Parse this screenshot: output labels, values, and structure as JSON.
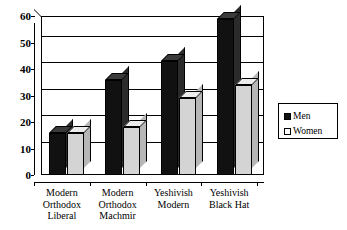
{
  "chart_data": {
    "type": "bar",
    "title": "",
    "subtitle": "",
    "xlabel": "",
    "ylabel": "",
    "ylim": [
      0,
      60
    ],
    "yticks": [
      0,
      10,
      20,
      30,
      40,
      50,
      60
    ],
    "grid": true,
    "legend_position": "right",
    "style": "3d-clustered-column",
    "categories": [
      "Modern Orthodox Liberal",
      "Modern Orthodox Machmir",
      "Yeshivish Modern",
      "Yeshivish Black Hat"
    ],
    "category_lines": [
      [
        "Modern",
        "Orthodox",
        "Liberal"
      ],
      [
        "Modern",
        "Orthodox",
        "Machmir"
      ],
      [
        "Yeshivish",
        "Modern"
      ],
      [
        "Yeshivish",
        "Black Hat"
      ]
    ],
    "series": [
      {
        "name": "Men",
        "color": "#111111",
        "values": [
          16,
          36,
          43,
          59
        ]
      },
      {
        "name": "Women",
        "color": "#d4d4d4",
        "values": [
          16,
          18,
          29,
          34
        ]
      }
    ]
  },
  "legend": {
    "items": [
      {
        "label": "Men",
        "swatch": "#111111"
      },
      {
        "label": "Women",
        "swatch": "#ffffff"
      }
    ]
  },
  "axis": {
    "y_tick_labels": [
      "60",
      "50",
      "40",
      "30",
      "20",
      "10",
      "0"
    ]
  }
}
